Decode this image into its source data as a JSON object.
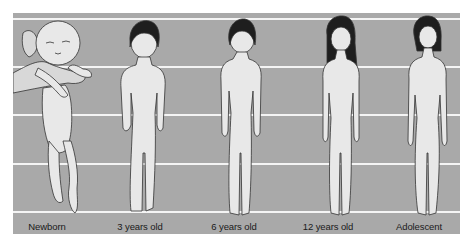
{
  "diagram": {
    "background_color": "#a9a9a9",
    "gridline_color": "#f4f4f4",
    "figure_fill": "#e8e8e8",
    "outline_color": "#333333",
    "hair_color": "#1e1e1e",
    "figures": [
      {
        "id": "newborn",
        "label": "Newborn"
      },
      {
        "id": "age-3",
        "label": "3 years old"
      },
      {
        "id": "age-6",
        "label": "6 years old"
      },
      {
        "id": "age-12",
        "label": "12 years old"
      },
      {
        "id": "adolescent",
        "label": "Adolescent"
      }
    ]
  }
}
